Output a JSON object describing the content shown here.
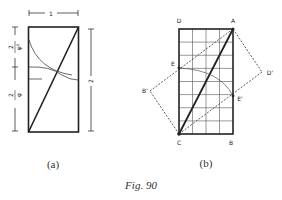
{
  "figure": {
    "caption": "Fig. 90",
    "panel_a": {
      "label": "(a)",
      "top_dimension": "1",
      "right_dimension": "2",
      "left_upper_fraction": {
        "numerator": "2",
        "denominator": "φ²"
      },
      "left_lower_fraction": {
        "numerator": "2",
        "denominator": "φ"
      }
    },
    "panel_b": {
      "label": "(b)",
      "grid": {
        "columns": 4,
        "rows": 8
      },
      "points": {
        "D": "D",
        "A": "A",
        "C": "C",
        "B": "B",
        "E": "E",
        "E_prime": "E'",
        "B_prime": "B'",
        "D_prime": "D'"
      }
    },
    "colors": {
      "ink": "#222222",
      "background": "#ffffff"
    }
  }
}
